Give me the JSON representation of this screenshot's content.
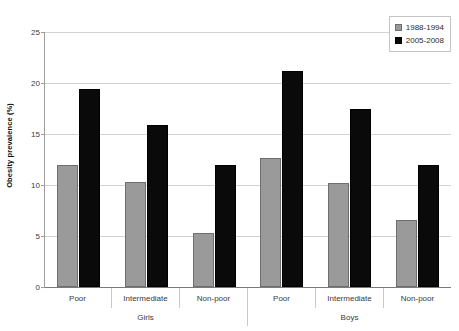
{
  "chart_data": {
    "type": "bar",
    "title": "",
    "xlabel": "",
    "ylabel": "Obesity prevalence (%)",
    "ylim": [
      0,
      25
    ],
    "yticks": [
      0,
      5,
      10,
      15,
      20,
      25
    ],
    "grid": true,
    "legend_position": "top-right",
    "categories": [
      "Poor",
      "Intermediate",
      "Non-poor",
      "Poor",
      "Intermediate",
      "Non-poor"
    ],
    "group_labels": [
      "Girls",
      "Boys"
    ],
    "series": [
      {
        "name": "1988-1994",
        "color": "#9a9a9a",
        "values": [
          12.0,
          10.3,
          5.3,
          12.6,
          10.2,
          6.6
        ]
      },
      {
        "name": "2005-2008",
        "color": "#0a0a0a",
        "values": [
          19.4,
          15.9,
          12.0,
          21.2,
          17.5,
          12.0
        ]
      }
    ]
  },
  "axis": {
    "y_title": "Obesity prevalence (%)",
    "y_tick_labels": [
      "25",
      "20",
      "15",
      "10",
      "5",
      "0"
    ]
  },
  "legend": {
    "items": [
      {
        "label": "1988-1994"
      },
      {
        "label": "2005-2008"
      }
    ]
  },
  "categories": {
    "cells": [
      "Poor",
      "Intermediate",
      "Non-poor",
      "Poor",
      "Intermediate",
      "Non-poor"
    ]
  },
  "supergroups": {
    "cells": [
      "Girls",
      "Boys"
    ]
  }
}
